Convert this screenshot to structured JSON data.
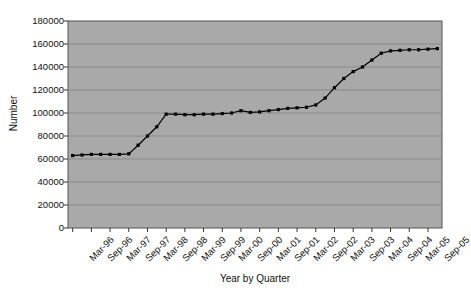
{
  "chart_data": {
    "type": "line",
    "title": "",
    "xlabel": "Year by Quarter",
    "ylabel": "Number",
    "ylim": [
      0,
      180000
    ],
    "ytick_values": [
      0,
      20000,
      40000,
      60000,
      80000,
      100000,
      120000,
      140000,
      160000,
      180000
    ],
    "ytick_labels": [
      "0",
      "20000",
      "40000",
      "60000",
      "80000",
      "100000",
      "120000",
      "140000",
      "160000",
      "180000"
    ],
    "grid": true,
    "legend": "none",
    "marker": "square",
    "line_color": "#000000",
    "marker_color": "#000000",
    "plot_background": "#a9a9a9",
    "gridline_color": "#8a8a8a",
    "figure_background": "#ffffff",
    "categories": [
      "Mar-96",
      "Jun-96",
      "Sep-96",
      "Dec-96",
      "Mar-97",
      "Jun-97",
      "Sep-97",
      "Dec-97",
      "Mar-98",
      "Jun-98",
      "Sep-98",
      "Dec-98",
      "Mar-99",
      "Jun-99",
      "Sep-99",
      "Dec-99",
      "Mar-00",
      "Jun-00",
      "Sep-00",
      "Dec-00",
      "Mar-01",
      "Jun-01",
      "Sep-01",
      "Dec-01",
      "Mar-02",
      "Jun-02",
      "Sep-02",
      "Dec-02",
      "Mar-03",
      "Jun-03",
      "Sep-03",
      "Dec-03",
      "Mar-04",
      "Jun-04",
      "Sep-04",
      "Dec-04",
      "Mar-05",
      "Jun-05",
      "Sep-05",
      "Dec-05"
    ],
    "xtick_labels": [
      "Mar-96",
      "Sep-96",
      "Mar-97",
      "Sep-97",
      "Mar-98",
      "Sep-98",
      "Mar-99",
      "Sep-99",
      "Mar-00",
      "Sep-00",
      "Mar-01",
      "Sep-01",
      "Mar-02",
      "Sep-02",
      "Mar-03",
      "Sep-03",
      "Mar-04",
      "Sep-04",
      "Mar-05",
      "Sep-05"
    ],
    "values": [
      63000,
      63500,
      64000,
      64000,
      64000,
      64000,
      64500,
      72000,
      80000,
      88000,
      99000,
      99000,
      98500,
      98500,
      99000,
      99000,
      99500,
      100000,
      102000,
      100500,
      101000,
      102000,
      103000,
      104000,
      104500,
      105000,
      107000,
      113000,
      122000,
      130000,
      136000,
      140000,
      146000,
      152000,
      154000,
      154500,
      155000,
      155000,
      155500,
      156000
    ]
  }
}
